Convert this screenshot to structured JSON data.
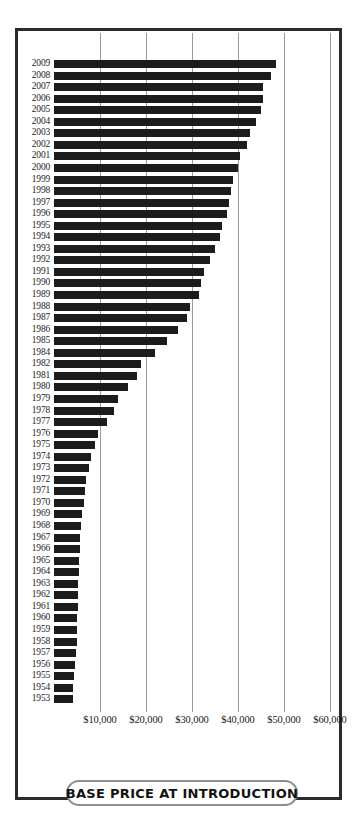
{
  "caption": {
    "text": "BASE PRICE AT INTRODUCTION"
  },
  "colors": {
    "bar": "#1c1c1c",
    "gridline": "#9a9a9a",
    "frame": "#2b2b2b",
    "caption_border": "#8e8e8e",
    "background": "#ffffff",
    "text": "#1a1a1a"
  },
  "chart_data": {
    "type": "bar",
    "orientation": "horizontal",
    "title": "BASE PRICE AT INTRODUCTION",
    "xlabel": "",
    "ylabel": "",
    "xlim": [
      0,
      62000
    ],
    "ylim": null,
    "grid": true,
    "gridlines": [
      10000,
      20000,
      30000,
      40000,
      50000,
      60000
    ],
    "tick_labels": [
      "$10,000",
      "$20,000",
      "$30,000",
      "$40,000",
      "$50,000",
      "$60,000"
    ],
    "legend": null,
    "note": "Years run 1953 to 2009 top-to-bottom in descending order; 1983 is absent from the chart.",
    "categories": [
      "2009",
      "2008",
      "2007",
      "2006",
      "2005",
      "2004",
      "2003",
      "2002",
      "2001",
      "2000",
      "1999",
      "1998",
      "1997",
      "1996",
      "1995",
      "1994",
      "1993",
      "1992",
      "1991",
      "1990",
      "1989",
      "1988",
      "1987",
      "1986",
      "1985",
      "1984",
      "1982",
      "1981",
      "1980",
      "1979",
      "1978",
      "1977",
      "1976",
      "1975",
      "1974",
      "1973",
      "1972",
      "1971",
      "1970",
      "1969",
      "1968",
      "1967",
      "1966",
      "1965",
      "1964",
      "1963",
      "1962",
      "1961",
      "1960",
      "1959",
      "1958",
      "1957",
      "1956",
      "1955",
      "1954",
      "1953"
    ],
    "values": [
      48300,
      47200,
      45500,
      45500,
      45000,
      44000,
      42500,
      42000,
      40500,
      40000,
      39000,
      38500,
      38000,
      37500,
      36500,
      36000,
      35000,
      34000,
      32500,
      32000,
      31500,
      29500,
      29000,
      27000,
      24500,
      22000,
      19000,
      18000,
      16000,
      14000,
      13000,
      11500,
      9500,
      9000,
      8000,
      7500,
      7000,
      6700,
      6500,
      6000,
      5800,
      5700,
      5600,
      5500,
      5400,
      5300,
      5300,
      5200,
      5100,
      5000,
      4900,
      4800,
      4600,
      4400,
      4200,
      4100
    ]
  },
  "scale": {
    "x_origin_px": 36,
    "px_per_10000": 46,
    "row_top_px": 28,
    "row_pitch_px": 11.55
  }
}
